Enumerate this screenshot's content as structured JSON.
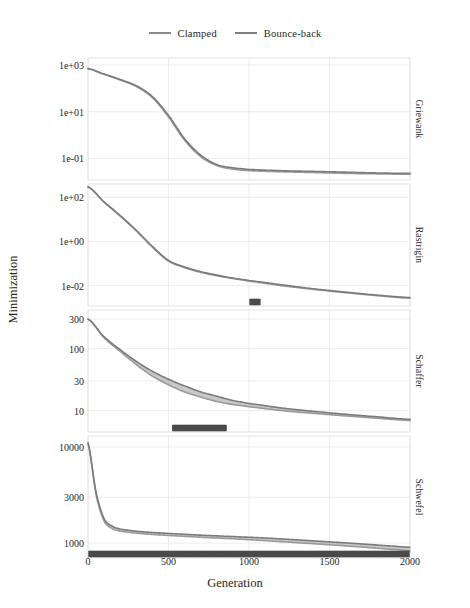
{
  "legend": {
    "items": [
      {
        "label": "Clamped",
        "color": "#9a9a9a"
      },
      {
        "label": "Bounce-back",
        "color": "#7c7c7c"
      }
    ]
  },
  "axes": {
    "xlabel": "Generation",
    "ylabel": "Minimization",
    "xticks": [
      "0",
      "500",
      "1000",
      "1500",
      "2000"
    ],
    "xtick_values": [
      0,
      500,
      1000,
      1500,
      2000
    ]
  },
  "panels": [
    {
      "name": "Griewank",
      "yticks": [
        "1e+03",
        "1e+01",
        "1e-01"
      ],
      "ytick_values": [
        1000,
        10,
        0.1
      ]
    },
    {
      "name": "Rastrigin",
      "yticks": [
        "1e+02",
        "1e+00",
        "1e-02"
      ],
      "ytick_values": [
        100,
        1,
        0.01
      ]
    },
    {
      "name": "Schaffer",
      "yticks": [
        "300",
        "100",
        "30",
        "10"
      ],
      "ytick_values": [
        300,
        100,
        30,
        10
      ]
    },
    {
      "name": "Schwefel",
      "yticks": [
        "10000",
        "3000",
        "1000"
      ],
      "ytick_values": [
        10000,
        3000,
        1000
      ]
    }
  ],
  "chart_data": {
    "type": "line",
    "title": "",
    "xlabel": "Generation",
    "ylabel": "Minimization",
    "yscale": "log",
    "grid": true,
    "legend_position": "top",
    "facets": [
      {
        "name": "Griewank",
        "ylim": [
          0.012,
          2000
        ],
        "yticks": [
          1000,
          10,
          0.1
        ],
        "ytick_labels": [
          "1e+03",
          "1e+01",
          "1e-01"
        ],
        "x": [
          0,
          100,
          200,
          300,
          400,
          500,
          600,
          700,
          800,
          900,
          1000,
          1200,
          1400,
          1600,
          1800,
          2000
        ],
        "series": [
          {
            "name": "Clamped",
            "values": [
              700,
              400,
              230,
              120,
              40,
              6,
              0.6,
              0.12,
              0.05,
              0.035,
              0.03,
              0.027,
              0.025,
              0.023,
              0.022,
              0.021
            ]
          },
          {
            "name": "Bounce-back",
            "values": [
              700,
              410,
              240,
              130,
              45,
              7,
              0.7,
              0.14,
              0.055,
              0.04,
              0.034,
              0.03,
              0.028,
              0.026,
              0.024,
              0.023
            ]
          }
        ],
        "significance_marks": []
      },
      {
        "name": "Rastrigin",
        "ylim": [
          0.0012,
          400
        ],
        "yticks": [
          100,
          1,
          0.01
        ],
        "ytick_labels": [
          "1e+02",
          "1e+00",
          "1e-02"
        ],
        "x": [
          0,
          100,
          200,
          300,
          400,
          500,
          600,
          700,
          800,
          900,
          1000,
          1200,
          1400,
          1600,
          1800,
          2000
        ],
        "series": [
          {
            "name": "Clamped",
            "values": [
              300,
              60,
              14,
              3.0,
              0.55,
              0.13,
              0.065,
              0.04,
              0.028,
              0.021,
              0.016,
              0.01,
              0.0068,
              0.0048,
              0.0035,
              0.0027
            ]
          },
          {
            "name": "Bounce-back",
            "values": [
              300,
              62,
              15,
              3.2,
              0.6,
              0.14,
              0.07,
              0.043,
              0.03,
              0.022,
              0.017,
              0.011,
              0.0072,
              0.0051,
              0.0037,
              0.0029
            ]
          }
        ],
        "significance_marks": [
          [
            1010,
            1070
          ]
        ]
      },
      {
        "name": "Schaffer",
        "ylim": [
          4.5,
          420
        ],
        "yticks": [
          300,
          100,
          30,
          10
        ],
        "ytick_labels": [
          "300",
          "100",
          "30",
          "10"
        ],
        "x": [
          0,
          100,
          200,
          300,
          400,
          500,
          600,
          700,
          800,
          900,
          1000,
          1200,
          1400,
          1600,
          1800,
          2000
        ],
        "series": [
          {
            "name": "Clamped",
            "values": [
              300,
              150,
              90,
              55,
              36,
              26,
              20,
              16.5,
              14,
              12.5,
              11.5,
              10,
              9,
              8.2,
              7.5,
              6.9
            ]
          },
          {
            "name": "Bounce-back",
            "values": [
              300,
              155,
              96,
              62,
              43,
              32,
              25,
              20,
              17,
              14.5,
              13,
              11,
              9.7,
              8.7,
              7.9,
              7.2
            ]
          }
        ],
        "significance_marks": [
          [
            530,
            860
          ]
        ]
      },
      {
        "name": "Schwefel",
        "ylim": [
          700,
          13000
        ],
        "yticks": [
          10000,
          3000,
          1000
        ],
        "ytick_labels": [
          "10000",
          "3000",
          "1000"
        ],
        "x": [
          0,
          50,
          100,
          150,
          200,
          300,
          400,
          500,
          700,
          900,
          1100,
          1300,
          1500,
          1700,
          1900,
          2000
        ],
        "series": [
          {
            "name": "Clamped",
            "values": [
              11000,
              3200,
              1700,
              1420,
              1330,
              1270,
              1230,
              1200,
              1150,
              1110,
              1060,
              1010,
              960,
              910,
              860,
              835
            ]
          },
          {
            "name": "Bounce-back",
            "values": [
              11000,
              3400,
              1800,
              1500,
              1400,
              1330,
              1290,
              1260,
              1210,
              1170,
              1130,
              1080,
              1030,
              980,
              930,
              905
            ]
          }
        ],
        "significance_marks": [
          [
            10,
            1990
          ]
        ]
      }
    ]
  }
}
